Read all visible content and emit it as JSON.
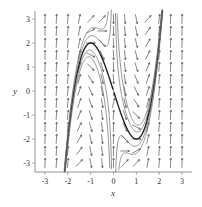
{
  "chart_data": {
    "type": "line",
    "subtype": "direction-field",
    "title": "",
    "xlabel": "x",
    "ylabel": "y",
    "xlim": [
      -3.3,
      3.3
    ],
    "ylim": [
      -3.3,
      3.3
    ],
    "x_ticks": [
      "-3",
      "-2",
      "-1",
      "0",
      "1",
      "2",
      "3"
    ],
    "y_ticks": [
      "3",
      "2",
      "1",
      "0",
      "-1",
      "-2",
      "-3"
    ],
    "grid": false,
    "legend": null,
    "arrow_grid": {
      "x_from": -3,
      "x_to": 3,
      "y_from": -3,
      "y_to": 3,
      "step": 0.5
    },
    "solution_curves": [
      {
        "name": "highlighted",
        "C": 0,
        "bold": true
      },
      {
        "name": "c1",
        "C": 0.6,
        "bold": false
      },
      {
        "name": "c2",
        "C": -0.6,
        "bold": false
      },
      {
        "name": "c3",
        "C": 0.3,
        "bold": false
      },
      {
        "name": "c4",
        "C": -0.3,
        "bold": false
      }
    ],
    "colors": {
      "arrow": "#555555",
      "curve": "#666666",
      "bold_curve": "#222222",
      "axis": "#777777"
    }
  }
}
